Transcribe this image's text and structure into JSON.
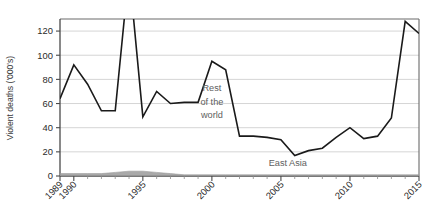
{
  "chart_data": {
    "type": "line",
    "title": "",
    "subtitle": "",
    "xlabel": "",
    "ylabel": "Violent deaths ('000's)",
    "ylim": [
      0,
      130
    ],
    "xlim": [
      1989,
      2015
    ],
    "grid": "horizontal",
    "legend_position": "inline-annotations",
    "y_ticks": [
      0,
      20,
      40,
      60,
      80,
      100,
      120
    ],
    "y_tick_labels": [
      "0",
      "20",
      "40",
      "60",
      "80",
      "100",
      "120"
    ],
    "x_ticks": [
      1989,
      1990,
      1995,
      2000,
      2005,
      2010,
      2015
    ],
    "x_tick_labels": [
      "1989",
      "1990",
      "1995",
      "2000",
      "2005",
      "2010",
      "2015"
    ],
    "x_minor_ticks": [
      1991,
      1992,
      1993,
      1994,
      1996,
      1997,
      1998,
      1999,
      2001,
      2002,
      2003,
      2004,
      2006,
      2007,
      2008,
      2009,
      2011,
      2012,
      2013,
      2014
    ],
    "x": [
      1989,
      1990,
      1991,
      1992,
      1993,
      1994,
      1995,
      1996,
      1997,
      1998,
      1999,
      2000,
      2001,
      2002,
      2003,
      2004,
      2005,
      2006,
      2007,
      2008,
      2009,
      2010,
      2011,
      2012,
      2013,
      2014,
      2015
    ],
    "series": [
      {
        "name": "Rest of the world",
        "color": "#1a1a1a",
        "kind": "line",
        "clipped_above": true,
        "values": [
          64,
          92,
          76,
          54,
          54,
          540,
          49,
          70,
          60,
          61,
          61,
          95,
          88,
          33,
          33,
          32,
          30,
          17,
          21,
          23,
          32,
          40,
          31,
          33,
          48,
          128,
          118
        ],
        "values_note": "1994 and 1996 spikes exceed the plotted axis maximum and are drawn as clipped vertical lines"
      },
      {
        "name": "East Asia",
        "color": "#9a9a9a",
        "kind": "area",
        "values": [
          2,
          2,
          2,
          2,
          3,
          4,
          4,
          3,
          2,
          1,
          1,
          1,
          1,
          1,
          1,
          1,
          1,
          1,
          1,
          1,
          1,
          1,
          1,
          1,
          1,
          1,
          1
        ]
      }
    ],
    "annotations": [
      {
        "text": "Rest",
        "x": 2000.0,
        "y": 70,
        "color": "#5e5e5e"
      },
      {
        "text": "of the",
        "x": 2000.0,
        "y": 59,
        "color": "#5e5e5e"
      },
      {
        "text": "world",
        "x": 2000.0,
        "y": 48,
        "color": "#5e5e5e"
      },
      {
        "text": "East Asia",
        "x": 2005.5,
        "y": 8,
        "color": "#8a8a8a"
      }
    ]
  },
  "colors": {
    "rest_of_world": "#1a1a1a",
    "east_asia": "#9a9a9a",
    "grid": "#d5d5d5",
    "axis": "#4a4a4a",
    "background": "#ffffff"
  }
}
